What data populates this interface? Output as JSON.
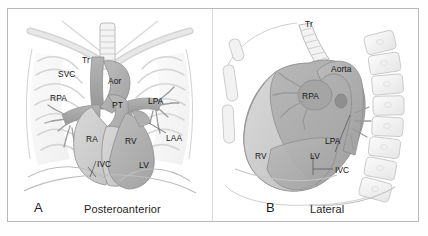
{
  "figure": {
    "type": "anatomical-diagram",
    "panels": [
      {
        "letter": "A",
        "title": "Posteroanterior",
        "structures": [
          {
            "abbr": "Tr",
            "name": "Trachea"
          },
          {
            "abbr": "SVC",
            "name": "Superior vena cava"
          },
          {
            "abbr": "Aor",
            "name": "Aorta"
          },
          {
            "abbr": "RPA",
            "name": "Right pulmonary artery"
          },
          {
            "abbr": "PT",
            "name": "Pulmonary trunk"
          },
          {
            "abbr": "LPA",
            "name": "Left pulmonary artery"
          },
          {
            "abbr": "LAA",
            "name": "Left atrial appendage"
          },
          {
            "abbr": "RA",
            "name": "Right atrium"
          },
          {
            "abbr": "RV",
            "name": "Right ventricle"
          },
          {
            "abbr": "IVC",
            "name": "Inferior vena cava"
          },
          {
            "abbr": "LV",
            "name": "Left ventricle"
          }
        ]
      },
      {
        "letter": "B",
        "title": "Lateral",
        "structures": [
          {
            "abbr": "Tr",
            "name": "Trachea"
          },
          {
            "abbr": "Aorta",
            "name": "Aorta"
          },
          {
            "abbr": "RPA",
            "name": "Right pulmonary artery"
          },
          {
            "abbr": "LPA",
            "name": "Left pulmonary artery"
          },
          {
            "abbr": "RV",
            "name": "Right ventricle"
          },
          {
            "abbr": "LV",
            "name": "Left ventricle"
          },
          {
            "abbr": "IVC",
            "name": "Inferior vena cava"
          }
        ]
      }
    ]
  },
  "colors": {
    "frame_border": "#b8b8b8",
    "divider": "#d9d9d9",
    "background": "#ffffff",
    "label_text": "#141414",
    "bone_light": "#f0f0f0",
    "bone_outline": "#c9c9c9",
    "chamber_light": "#cfcfcf",
    "chamber_mid": "#bdbdbd",
    "chamber_dark": "#a6a6a6",
    "vessel_dark": "#9a9a9a",
    "outline": "#8f8f8f"
  }
}
